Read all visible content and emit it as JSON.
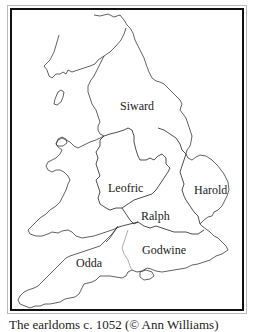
{
  "map": {
    "regions": [
      {
        "id": "siward",
        "label": "Siward"
      },
      {
        "id": "leofric",
        "label": "Leofric"
      },
      {
        "id": "harold",
        "label": "Harold"
      },
      {
        "id": "ralph",
        "label": "Ralph"
      },
      {
        "id": "godwine",
        "label": "Godwine"
      },
      {
        "id": "odda",
        "label": "Odda"
      }
    ],
    "colors": {
      "coast": "#3a3a3a",
      "border": "#111111",
      "frame_outer": "#b8b8b8"
    }
  },
  "caption": "The earldoms c. 1052 (© Ann Williams)"
}
